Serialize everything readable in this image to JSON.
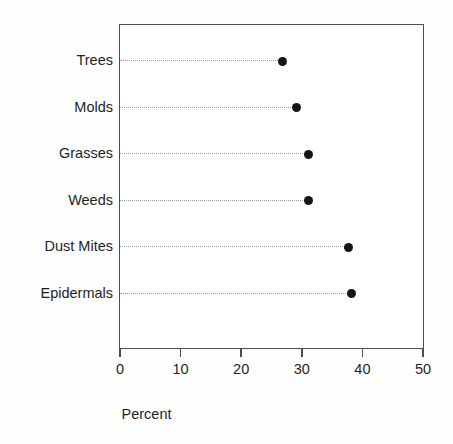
{
  "chart_data": {
    "type": "scatter",
    "subtype": "cleveland-dot-plot",
    "title": "",
    "subtitle": "",
    "xlabel": "Percent",
    "ylabel": "",
    "categories": [
      "Trees",
      "Molds",
      "Grasses",
      "Weeds",
      "Dust Mites",
      "Epidermals"
    ],
    "values": [
      26.6,
      29.0,
      31.0,
      31.0,
      37.6,
      38.1
    ],
    "points": [
      {
        "category": "Trees",
        "value": 26.6
      },
      {
        "category": "Molds",
        "value": 29.0
      },
      {
        "category": "Grasses",
        "value": 31.0
      },
      {
        "category": "Weeds",
        "value": 31.0
      },
      {
        "category": "Dust Mites",
        "value": 37.6
      },
      {
        "category": "Epidermals",
        "value": 38.1
      }
    ],
    "xlim": [
      0,
      50
    ],
    "xticks": [
      0,
      10,
      20,
      30,
      40,
      50
    ],
    "xtick_labels": [
      "0",
      "10",
      "20",
      "30",
      "40",
      "50"
    ],
    "grid": false,
    "legend": false,
    "legend_position": "none",
    "leader_lines": true,
    "colors": {
      "dot": "#151515",
      "leader_line": "#9a9a9a",
      "frame": "#4d4d4d",
      "text": "#1f1f1f",
      "background": "#ffffff"
    }
  }
}
